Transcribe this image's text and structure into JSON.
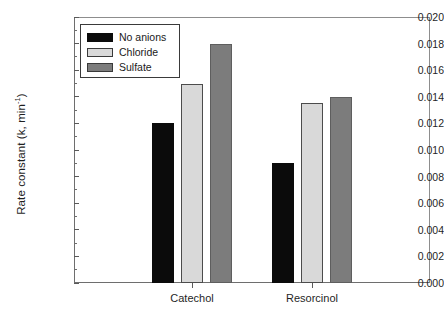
{
  "chart_data": {
    "type": "bar",
    "title": "",
    "subtitle": "",
    "xlabel": "",
    "ylabel": "Rate constant (k, min⁻¹)",
    "ylabel_base": "Rate constant (k, min",
    "ylabel_exponent": "-1",
    "ylabel_close": ")",
    "categories": [
      "Catechol",
      "Resorcinol"
    ],
    "series": [
      {
        "name": "No anions",
        "color": "#0b0b0b",
        "values": [
          0.012,
          0.009
        ]
      },
      {
        "name": "Chloride",
        "color": "#d9d9d9",
        "values": [
          0.015,
          0.0135
        ]
      },
      {
        "name": "Sulfate",
        "color": "#7c7c7c",
        "values": [
          0.018,
          0.014
        ]
      }
    ],
    "ylim": [
      0.0,
      0.02
    ],
    "ytick_labels": [
      "0.020",
      "0.018",
      "0.016",
      "0.014",
      "0.012",
      "0.010",
      "0.008",
      "0.006",
      "0.004",
      "0.002",
      "0.000"
    ],
    "ytick_values": [
      0.02,
      0.018,
      0.016,
      0.014,
      0.012,
      0.01,
      0.008,
      0.006,
      0.004,
      0.002,
      0.0
    ],
    "yminor_values": [
      0.019,
      0.017,
      0.015,
      0.013,
      0.011,
      0.009,
      0.007,
      0.005,
      0.003,
      0.001
    ],
    "grid": false,
    "legend_position": "top-left",
    "legend_entries": [
      "No anions",
      "Chloride",
      "Sulfate"
    ]
  }
}
